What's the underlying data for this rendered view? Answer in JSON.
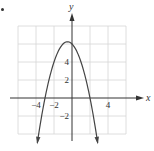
{
  "marker": "•",
  "chart_data": {
    "type": "line",
    "title": "",
    "xlabel": "x",
    "ylabel": "y",
    "function": "y = -x^2 - x + 6",
    "xlim": [
      -6,
      6
    ],
    "ylim": [
      -4,
      8
    ],
    "grid": true,
    "grid_step": 2,
    "x_ticks": [
      {
        "value": -4,
        "label": "−4"
      },
      {
        "value": -2,
        "label": "−2"
      },
      {
        "value": 4,
        "label": "4"
      }
    ],
    "y_ticks": [
      {
        "value": 2,
        "label": "2"
      },
      {
        "value": 4,
        "label": "4"
      },
      {
        "value": -2,
        "label": "−2"
      }
    ],
    "vertex": [
      -0.5,
      6.25
    ],
    "x_intercepts": [
      -3,
      2
    ],
    "y_intercept": 6,
    "series": [
      {
        "name": "parabola",
        "x": [
          -4,
          -3.5,
          -3,
          -2.5,
          -2,
          -1.5,
          -1,
          -0.5,
          0,
          0.5,
          1,
          1.5,
          2,
          2.5,
          3
        ],
        "y": [
          -6,
          -2.75,
          0,
          2.25,
          4,
          5.25,
          6,
          6.25,
          6,
          5.25,
          4,
          2.25,
          0,
          -2.75,
          -6
        ],
        "endpoints_arrowed": true
      }
    ],
    "colors": {
      "grid": "#d6d6d6",
      "axis": "#333333",
      "curve": "#444444",
      "text": "#333333"
    }
  }
}
